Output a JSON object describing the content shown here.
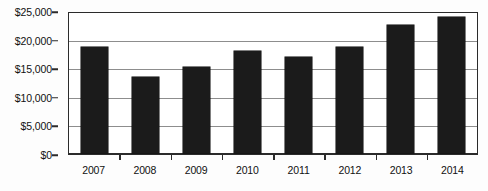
{
  "chart_data": {
    "type": "bar",
    "title": "",
    "subtitle": "",
    "xlabel": "",
    "ylabel": "",
    "categories": [
      "2007",
      "2008",
      "2009",
      "2010",
      "2011",
      "2012",
      "2013",
      "2014"
    ],
    "values": [
      19000,
      13600,
      15400,
      18200,
      17100,
      19000,
      22900,
      24300
    ],
    "series": [
      {
        "name": "",
        "values": [
          19000,
          13600,
          15400,
          18200,
          17100,
          19000,
          22900,
          24300
        ],
        "color": "#1b1b1b"
      }
    ],
    "ylim": [
      0,
      25000
    ],
    "ytick_values": [
      0,
      5000,
      10000,
      15000,
      20000,
      25000
    ],
    "ytick_labels": [
      "$0",
      "$5,000",
      "$10,000",
      "$15,000",
      "$20,000",
      "$25,000"
    ],
    "grid": true,
    "grid_axis": "y",
    "legend": false,
    "legend_position": "none",
    "annotations": [],
    "gridline_color": "#8d8d8d",
    "axis_color": "#2b2b2b",
    "plot_background": "#ffffff"
  }
}
